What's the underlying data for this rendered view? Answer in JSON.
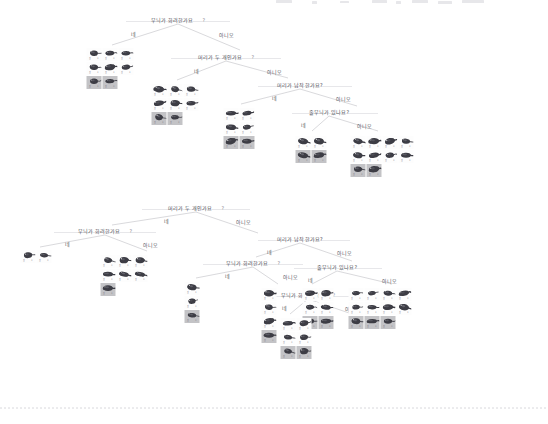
{
  "page": {
    "background": "#ffffff",
    "line_color": "#b9b9bf",
    "text_color": "#4e4e56",
    "highlight_color": "#c3c3c6"
  },
  "labels": {
    "yes": "네",
    "no": "아니오",
    "question_mark": "?"
  },
  "questions": {
    "pattern_fancy": "무늬가 화려한가요",
    "two_heads": "머리가 두 개인가요",
    "head_flat": "머리가 납작한가요?",
    "has_stripes": "줄무늬가 있나요?"
  },
  "trees": [
    {
      "id": "tree-top",
      "nodes": [
        {
          "id": "t-n1",
          "type": "question",
          "text": "무늬가 화려한가요",
          "mark": "?",
          "x": 178,
          "y": 18,
          "rule_w": 104
        },
        {
          "id": "t-e1-yes",
          "type": "edge-label",
          "text": "네",
          "x": 133,
          "y": 32
        },
        {
          "id": "t-e1-no",
          "type": "edge-label",
          "text": "아니오",
          "x": 226,
          "y": 33
        },
        {
          "id": "t-n2",
          "type": "question",
          "text": "머리가 두 개인가요",
          "mark": "?",
          "x": 226,
          "y": 55,
          "rule_w": 110
        },
        {
          "id": "t-e2-yes",
          "type": "edge-label",
          "text": "네",
          "x": 196,
          "y": 69
        },
        {
          "id": "t-e2-no",
          "type": "edge-label",
          "text": "아니오",
          "x": 274,
          "y": 70
        },
        {
          "id": "t-n3",
          "type": "question",
          "text": "머리가 납작한가요?",
          "mark": "",
          "x": 300,
          "y": 83,
          "rule_w": 0
        },
        {
          "id": "t-e3-yes",
          "type": "edge-label",
          "text": "네",
          "x": 274,
          "y": 96
        },
        {
          "id": "t-e3-no",
          "type": "edge-label",
          "text": "아니오",
          "x": 343,
          "y": 97
        },
        {
          "id": "t-n4",
          "type": "question",
          "text": "줄무늬가 있나요?",
          "mark": "",
          "x": 329,
          "y": 110,
          "rule_w": 0
        },
        {
          "id": "t-e4-yes",
          "type": "edge-label",
          "text": "네",
          "x": 303,
          "y": 123
        },
        {
          "id": "t-e4-no",
          "type": "edge-label",
          "text": "아니오",
          "x": 364,
          "y": 124
        }
      ],
      "leaves": [
        {
          "id": "t-leaf-a",
          "x": 110,
          "y": 48,
          "cols": 3,
          "count": 8,
          "highlight_from": 6
        },
        {
          "id": "t-leaf-b",
          "x": 175,
          "y": 84,
          "cols": 3,
          "count": 8,
          "highlight_from": 6
        },
        {
          "id": "t-leaf-c",
          "x": 239,
          "y": 108,
          "cols": 2,
          "count": 6,
          "highlight_from": 4
        },
        {
          "id": "t-leaf-d",
          "x": 311,
          "y": 136,
          "cols": 2,
          "count": 4,
          "highlight_from": 2
        },
        {
          "id": "t-leaf-e",
          "x": 382,
          "y": 136,
          "cols": 4,
          "count": 10,
          "highlight_from": 8
        }
      ]
    },
    {
      "id": "tree-bottom",
      "nodes": [
        {
          "id": "b-n1",
          "type": "question",
          "text": "머리가 두 개인가요",
          "mark": "?",
          "x": 196,
          "y": 206,
          "rule_w": 108
        },
        {
          "id": "b-e1-yes",
          "type": "edge-label",
          "text": "네",
          "x": 166,
          "y": 219
        },
        {
          "id": "b-e1-no",
          "type": "edge-label",
          "text": "아니오",
          "x": 243,
          "y": 220
        },
        {
          "id": "b-n2",
          "type": "question",
          "text": "무늬가 화려한가요",
          "mark": "?",
          "x": 105,
          "y": 229,
          "rule_w": 102
        },
        {
          "id": "b-e2-yes",
          "type": "edge-label",
          "text": "네",
          "x": 67,
          "y": 242
        },
        {
          "id": "b-e2-no",
          "type": "edge-label",
          "text": "아니오",
          "x": 150,
          "y": 243
        },
        {
          "id": "b-n3",
          "type": "question",
          "text": "머리가 납작한가요?",
          "mark": "",
          "x": 300,
          "y": 237,
          "rule_w": 0
        },
        {
          "id": "b-e3-yes",
          "type": "edge-label",
          "text": "네",
          "x": 269,
          "y": 250
        },
        {
          "id": "b-e3-no",
          "type": "edge-label",
          "text": "아니오",
          "x": 344,
          "y": 251
        },
        {
          "id": "b-n4",
          "type": "question",
          "text": "무늬가 화려한가요",
          "mark": "?",
          "x": 253,
          "y": 261,
          "rule_w": 100
        },
        {
          "id": "b-e4-yes",
          "type": "edge-label",
          "text": "네",
          "x": 227,
          "y": 274
        },
        {
          "id": "b-e4-no",
          "type": "edge-label",
          "text": "아니오",
          "x": 290,
          "y": 275
        },
        {
          "id": "b-n5",
          "type": "question",
          "text": "줄무늬가 있나요?",
          "mark": "",
          "x": 337,
          "y": 265,
          "rule_w": 0
        },
        {
          "id": "b-e5-yes",
          "type": "edge-label",
          "text": "네",
          "x": 310,
          "y": 278
        },
        {
          "id": "b-e5-no",
          "type": "edge-label",
          "text": "아니오",
          "x": 389,
          "y": 279
        },
        {
          "id": "b-n6",
          "type": "question",
          "text": "무늬가 화려한가요",
          "mark": "?",
          "x": 308,
          "y": 293,
          "rule_w": 86
        },
        {
          "id": "b-e6-yes",
          "type": "edge-label",
          "text": "네",
          "x": 284,
          "y": 306
        },
        {
          "id": "b-e6-no",
          "type": "edge-label",
          "text": "아니오",
          "x": 352,
          "y": 307
        }
      ],
      "leaves": [
        {
          "id": "b-leaf-a",
          "x": 36,
          "y": 250,
          "cols": 2,
          "count": 2,
          "highlight_from": 9
        },
        {
          "id": "b-leaf-b",
          "x": 124,
          "y": 255,
          "cols": 3,
          "count": 7,
          "highlight_from": 6
        },
        {
          "id": "b-leaf-c",
          "x": 192,
          "y": 282,
          "cols": 1,
          "count": 3,
          "highlight_from": 2
        },
        {
          "id": "b-leaf-d",
          "x": 269,
          "y": 288,
          "cols": 1,
          "count": 4,
          "highlight_from": 3
        },
        {
          "id": "b-leaf-e",
          "x": 318,
          "y": 288,
          "cols": 2,
          "count": 6,
          "highlight_from": 4
        },
        {
          "id": "b-leaf-f",
          "x": 296,
          "y": 318,
          "cols": 2,
          "count": 6,
          "highlight_from": 4
        },
        {
          "id": "b-leaf-g",
          "x": 380,
          "y": 288,
          "cols": 4,
          "count": 11,
          "highlight_from": 8
        }
      ]
    }
  ],
  "divider": {
    "y": 408,
    "style": "dashed"
  },
  "cell_caption": {
    "left": "원",
    "right": "0"
  }
}
